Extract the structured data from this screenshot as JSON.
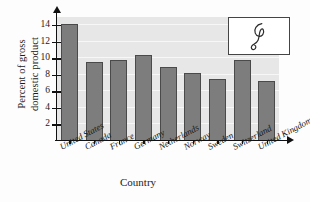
{
  "chart_data": {
    "type": "bar",
    "title": "",
    "xlabel": "Country",
    "ylabel": "Percent of gross domestic product",
    "ylabel_lines": [
      "Percent of gross",
      "domestic product"
    ],
    "categories": [
      "United States",
      "Canada",
      "France",
      "Germany",
      "Netherlands",
      "Norway",
      "Sweden",
      "Switzerland",
      "United Kingdom"
    ],
    "values": [
      14.2,
      9.6,
      9.8,
      10.4,
      9.0,
      8.2,
      7.5,
      9.8,
      7.2
    ],
    "ylim": [
      0,
      15
    ],
    "yticks": [
      2,
      4,
      6,
      8,
      10,
      12,
      14
    ],
    "ytick_labels": [
      "2",
      "4",
      "6",
      "8",
      "10",
      "12",
      "14"
    ],
    "grid": true,
    "legend": "none",
    "bar_color": "#7d7d7d",
    "bar_edge_color": "#4a4a4a",
    "plot_background": "#e7e7e7"
  },
  "inset": {
    "name": "doodle-loop",
    "description": "hand-drawn loop squiggle",
    "stroke_color": "#2b2b2b",
    "background": "#ffffff"
  }
}
